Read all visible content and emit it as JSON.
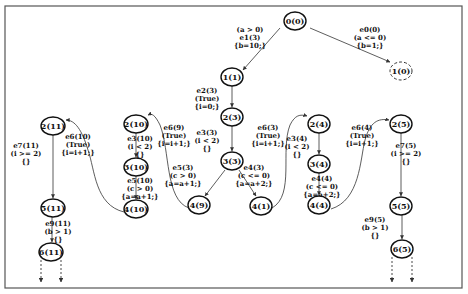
{
  "diagram": {
    "nodes": [
      {
        "id": "n0_0",
        "label": "0(0)",
        "x": 295,
        "y": 21,
        "style": "solid"
      },
      {
        "id": "n1_0",
        "label": "1(0)",
        "x": 401,
        "y": 71,
        "style": "dashed"
      },
      {
        "id": "n1_1",
        "label": "1(1)",
        "x": 232,
        "y": 77,
        "style": "solid"
      },
      {
        "id": "n2_3",
        "label": "2(3)",
        "x": 232,
        "y": 117,
        "style": "solid"
      },
      {
        "id": "n3_3",
        "label": "3(3)",
        "x": 232,
        "y": 161,
        "style": "solid"
      },
      {
        "id": "n4_9",
        "label": "4(9)",
        "x": 199,
        "y": 205,
        "style": "solid"
      },
      {
        "id": "n4_1",
        "label": "4(1)",
        "x": 261,
        "y": 206,
        "style": "solid"
      },
      {
        "id": "n2_10",
        "label": "2(10)",
        "x": 136,
        "y": 124,
        "style": "solid"
      },
      {
        "id": "n3_10",
        "label": "3(10)",
        "x": 136,
        "y": 167,
        "style": "solid"
      },
      {
        "id": "n4_10",
        "label": "4(10)",
        "x": 136,
        "y": 209,
        "style": "solid"
      },
      {
        "id": "n2_11",
        "label": "2(11)",
        "x": 53,
        "y": 126,
        "style": "solid"
      },
      {
        "id": "n5_11",
        "label": "5(11)",
        "x": 53,
        "y": 208,
        "style": "solid"
      },
      {
        "id": "n6_11",
        "label": "6(11)",
        "x": 51,
        "y": 252,
        "style": "solid"
      },
      {
        "id": "n2_4",
        "label": "2(4)",
        "x": 319,
        "y": 124,
        "style": "solid"
      },
      {
        "id": "n3_4",
        "label": "3(4)",
        "x": 319,
        "y": 164,
        "style": "solid"
      },
      {
        "id": "n4_4",
        "label": "4(4)",
        "x": 319,
        "y": 205,
        "style": "solid"
      },
      {
        "id": "n2_5",
        "label": "2(5)",
        "x": 401,
        "y": 124,
        "style": "solid"
      },
      {
        "id": "n5_5",
        "label": "5(5)",
        "x": 401,
        "y": 206,
        "style": "solid"
      },
      {
        "id": "n6_5",
        "label": "6(5)",
        "x": 402,
        "y": 249,
        "style": "solid"
      }
    ],
    "edges": [
      {
        "id": "e1_3",
        "lines": [
          "(a > 0)",
          "e1(3)",
          "{b=10;}"
        ],
        "lx": 250,
        "ly": 32
      },
      {
        "id": "e0_0",
        "lines": [
          "e0(0)",
          "(a <= 0)",
          "{b=1;}"
        ],
        "lx": 370,
        "ly": 32
      },
      {
        "id": "e2_3",
        "lines": [
          "e2(3)",
          "(True)",
          "{i=0;}"
        ],
        "lx": 207,
        "ly": 93
      },
      {
        "id": "e3_3",
        "lines": [
          "e3(3)",
          "(i < 2)",
          "{}"
        ],
        "lx": 207,
        "ly": 135
      },
      {
        "id": "e5_3",
        "lines": [
          "e5(3)",
          "(c > 0)",
          "{a=a+1;}"
        ],
        "lx": 183,
        "ly": 170
      },
      {
        "id": "e4_3",
        "lines": [
          "e4(3)",
          "(c <= 0)",
          "{a=a+2;}"
        ],
        "lx": 254,
        "ly": 170
      },
      {
        "id": "e6_3",
        "lines": [
          "e6(3)",
          "(True)",
          "{i=i+1;}"
        ],
        "lx": 268,
        "ly": 130
      },
      {
        "id": "e6_9",
        "lines": [
          "e6(9)",
          "(True)",
          "{i=i+1;}"
        ],
        "lx": 174,
        "ly": 130
      },
      {
        "id": "e3_10",
        "lines": [
          "e3(10)",
          "(i < 2)",
          "{}"
        ],
        "lx": 140,
        "ly": 141
      },
      {
        "id": "e5_10",
        "lines": [
          "e5(10)",
          "(c > 0)",
          "{a=a+1;}"
        ],
        "lx": 140,
        "ly": 183
      },
      {
        "id": "e6_10",
        "lines": [
          "e6(10)",
          "(True)",
          "{i=i+1;}"
        ],
        "lx": 78,
        "ly": 139
      },
      {
        "id": "e7_11",
        "lines": [
          "e7(11)",
          "(i >= 2)",
          "{}"
        ],
        "lx": 26,
        "ly": 148
      },
      {
        "id": "e9_11",
        "lines": [
          "e9(11)",
          "(b > 1)",
          "{}"
        ],
        "lx": 58,
        "ly": 226
      },
      {
        "id": "e3_4",
        "lines": [
          "e3(4)",
          "(i < 2)",
          "{}"
        ],
        "lx": 297,
        "ly": 141
      },
      {
        "id": "e4_4",
        "lines": [
          "e4(4)",
          "(c <= 0)",
          "{a=a+2;}"
        ],
        "lx": 322,
        "ly": 181
      },
      {
        "id": "e6_4",
        "lines": [
          "e6(4)",
          "(True)",
          "{i=i+1;}"
        ],
        "lx": 362,
        "ly": 130
      },
      {
        "id": "e7_5",
        "lines": [
          "e7(5)",
          "(i >= 2)",
          "{}"
        ],
        "lx": 406,
        "ly": 148
      },
      {
        "id": "e9_5",
        "lines": [
          "e9(5)",
          "(b > 1)",
          "{}"
        ],
        "lx": 375,
        "ly": 222
      }
    ]
  }
}
